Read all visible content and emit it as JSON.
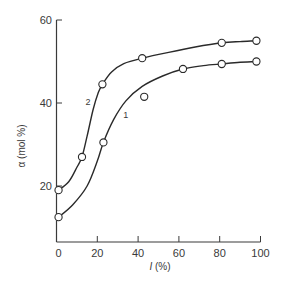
{
  "chart_data": {
    "type": "line",
    "title": "",
    "xlabel": "I (%)",
    "xlabel_parts": {
      "symbol": "I",
      "unit": " (%)"
    },
    "ylabel": "α (mol %)",
    "xlim": [
      0,
      100
    ],
    "ylim": [
      0,
      60
    ],
    "x_ticks": [
      0,
      20,
      40,
      60,
      80,
      100
    ],
    "x_tick_labels": [
      "0",
      "20",
      "40",
      "60",
      "80",
      "100"
    ],
    "y_ticks": [
      20,
      40,
      60
    ],
    "y_tick_labels": [
      "20",
      "40",
      "60"
    ],
    "grid": false,
    "legend": "inline curve labels",
    "series": [
      {
        "name": "1",
        "label": "1",
        "markers": [
          {
            "x": 1,
            "y": 12.5
          },
          {
            "x": 23,
            "y": 30.5
          },
          {
            "x": 43,
            "y": 41.5
          },
          {
            "x": 62,
            "y": 48.2
          },
          {
            "x": 81,
            "y": 49.4
          },
          {
            "x": 98,
            "y": 50
          }
        ],
        "curve": [
          {
            "x": 1,
            "y": 12.5
          },
          {
            "x": 8,
            "y": 15.5
          },
          {
            "x": 15,
            "y": 20
          },
          {
            "x": 20,
            "y": 26
          },
          {
            "x": 23,
            "y": 30.5
          },
          {
            "x": 28,
            "y": 36
          },
          {
            "x": 34,
            "y": 40.5
          },
          {
            "x": 42,
            "y": 44
          },
          {
            "x": 52,
            "y": 46.5
          },
          {
            "x": 62,
            "y": 48.2
          },
          {
            "x": 72,
            "y": 49
          },
          {
            "x": 81,
            "y": 49.4
          },
          {
            "x": 90,
            "y": 49.8
          },
          {
            "x": 98,
            "y": 50
          }
        ],
        "label_pos": {
          "x": 34,
          "y": 36.5
        }
      },
      {
        "name": "2",
        "label": "2",
        "markers": [
          {
            "x": 1,
            "y": 19
          },
          {
            "x": 12.5,
            "y": 27
          },
          {
            "x": 22.5,
            "y": 44.5
          },
          {
            "x": 42,
            "y": 50.8
          },
          {
            "x": 81,
            "y": 54.5
          },
          {
            "x": 98,
            "y": 55
          }
        ],
        "curve": [
          {
            "x": 1,
            "y": 19
          },
          {
            "x": 6,
            "y": 21
          },
          {
            "x": 10,
            "y": 24.5
          },
          {
            "x": 12.5,
            "y": 27
          },
          {
            "x": 15,
            "y": 32
          },
          {
            "x": 18,
            "y": 38.5
          },
          {
            "x": 20.5,
            "y": 42.5
          },
          {
            "x": 22.5,
            "y": 44.5
          },
          {
            "x": 27,
            "y": 47.5
          },
          {
            "x": 33,
            "y": 49.5
          },
          {
            "x": 42,
            "y": 50.8
          },
          {
            "x": 55,
            "y": 52.2
          },
          {
            "x": 68,
            "y": 53.5
          },
          {
            "x": 81,
            "y": 54.5
          },
          {
            "x": 90,
            "y": 54.8
          },
          {
            "x": 98,
            "y": 55
          }
        ],
        "label_pos": {
          "x": 15.5,
          "y": 39.5
        }
      }
    ]
  }
}
